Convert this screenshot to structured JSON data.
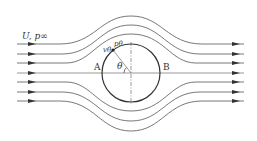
{
  "diagram": {
    "labels": {
      "freestream": "U, p∞",
      "point_A": "A",
      "point_B": "B",
      "angle": "θ",
      "surface_velocity": "vθ",
      "surface_pressure": "pθ"
    },
    "cylinder": {
      "cx": 131,
      "cy": 73,
      "r": 29
    },
    "streamlines": {
      "count": 7,
      "upstream_y": [
        44,
        54,
        63,
        73,
        82,
        92,
        101
      ],
      "flow_direction": "left-to-right"
    },
    "colors": {
      "line": "#555555",
      "cylinder": "#333333",
      "text": "#333333"
    }
  }
}
